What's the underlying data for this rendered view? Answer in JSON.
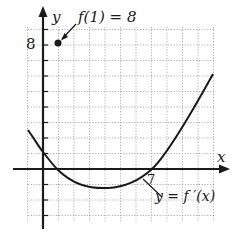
{
  "chart_data": {
    "type": "line",
    "title": "",
    "xlabel": "x",
    "ylabel": "y",
    "xlim": [
      -1,
      11
    ],
    "ylim": [
      -4,
      9
    ],
    "grid": true,
    "grid_step": 1,
    "series": [
      {
        "name": "y = f ′(x)",
        "x": [
          -1,
          0,
          1,
          2,
          3,
          4,
          5,
          6,
          7,
          8,
          9,
          10,
          11
        ],
        "values": [
          1.4,
          0.6,
          0,
          -0.5,
          -0.9,
          -1.2,
          -1.2,
          -0.8,
          0,
          1.2,
          2.6,
          4.0,
          6.1
        ]
      }
    ],
    "annotations": [
      {
        "text": "f(1) = 8",
        "point": [
          1,
          8
        ]
      },
      {
        "text": "7",
        "position": "x-intercept of f′",
        "x": 7
      },
      {
        "text": "y = f ′(x)",
        "target": "curve"
      }
    ],
    "tick_labels": {
      "y": [
        "8"
      ],
      "x": [
        "7"
      ]
    }
  },
  "labels": {
    "x_axis": "x",
    "y_axis": "y",
    "y_tick_8": "8",
    "x_tick_7": "7",
    "point_annotation": "f(1) = 8",
    "curve_label": "y = f ′(x)"
  }
}
